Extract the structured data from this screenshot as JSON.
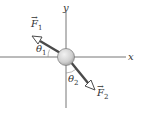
{
  "diagram": {
    "axes": {
      "x_label": "x",
      "y_label": "y"
    },
    "body": {
      "shape": "circle",
      "fill": "#d8d8d8"
    },
    "vectors": [
      {
        "name": "F",
        "subscript": "1",
        "arrow": "→",
        "direction": "up-left"
      },
      {
        "name": "F",
        "subscript": "2",
        "arrow": "→",
        "direction": "down-right"
      }
    ],
    "angles": [
      {
        "symbol": "θ",
        "subscript": "1",
        "between": "F1 and negative x-axis"
      },
      {
        "symbol": "θ",
        "subscript": "2",
        "between": "F2 and negative y-axis"
      }
    ],
    "colors": {
      "line": "#555555",
      "arrow": "#4a4a4a",
      "circle_fill": "#d8d8d8"
    }
  }
}
